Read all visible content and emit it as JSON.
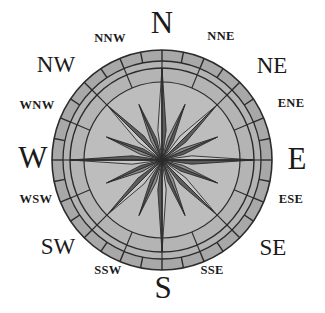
{
  "figure": {
    "name": "compass-rose",
    "background_color": "#ffffff"
  },
  "colors": {
    "ink": "#1a1a1a",
    "outline": "#2b2b2b",
    "ring_fill": "#b4b4b4",
    "ring_fill_alt": "#a8a8a8",
    "inner_fill": "#bdbdbd",
    "point_light": "#c6c6c6",
    "point_dark": "#5c5c5c",
    "point_mid": "#8a8a8a",
    "paper": "#ffffff"
  },
  "geometry": {
    "center_x": 162,
    "center_y": 160,
    "outer_radius": 110,
    "tick_ring_inner_radius": 99,
    "ring_inner_radius": 92,
    "inner_circle_radius": 78,
    "cardinal_point_radius": 92,
    "ordinal_point_radius": 78,
    "secondary_point_radius": 60,
    "point_half_width_deg": 8,
    "tick_count": 32
  },
  "labels": {
    "cardinals": [
      {
        "id": "north",
        "text": "N",
        "x": 162,
        "y": 22,
        "angle_deg": 0
      },
      {
        "id": "east",
        "text": "E",
        "x": 297,
        "y": 158,
        "angle_deg": 90
      },
      {
        "id": "south",
        "text": "S",
        "x": 163,
        "y": 287,
        "angle_deg": 180
      },
      {
        "id": "west",
        "text": "W",
        "x": 33,
        "y": 157,
        "angle_deg": 270
      }
    ],
    "ordinals": [
      {
        "id": "northeast",
        "text": "NE",
        "x": 272,
        "y": 65,
        "angle_deg": 45
      },
      {
        "id": "southeast",
        "text": "SE",
        "x": 273,
        "y": 247,
        "angle_deg": 135
      },
      {
        "id": "southwest",
        "text": "SW",
        "x": 58,
        "y": 246,
        "angle_deg": 225
      },
      {
        "id": "northwest",
        "text": "NW",
        "x": 56,
        "y": 64,
        "angle_deg": 315
      }
    ],
    "secondaries": [
      {
        "id": "north-northeast",
        "text": "NNE",
        "x": 221,
        "y": 36,
        "angle_deg": 22.5
      },
      {
        "id": "east-northeast",
        "text": "ENE",
        "x": 291,
        "y": 103,
        "angle_deg": 67.5
      },
      {
        "id": "east-southeast",
        "text": "ESE",
        "x": 291,
        "y": 199,
        "angle_deg": 112.5
      },
      {
        "id": "south-southeast",
        "text": "SSE",
        "x": 212,
        "y": 270,
        "angle_deg": 157.5
      },
      {
        "id": "south-southwest",
        "text": "SSW",
        "x": 108,
        "y": 270,
        "angle_deg": 202.5
      },
      {
        "id": "west-southwest",
        "text": "WSW",
        "x": 36,
        "y": 199,
        "angle_deg": 247.5
      },
      {
        "id": "west-northwest",
        "text": "WNW",
        "x": 37,
        "y": 105,
        "angle_deg": 292.5
      },
      {
        "id": "north-northwest",
        "text": "NNW",
        "x": 110,
        "y": 38,
        "angle_deg": 337.5
      }
    ]
  }
}
